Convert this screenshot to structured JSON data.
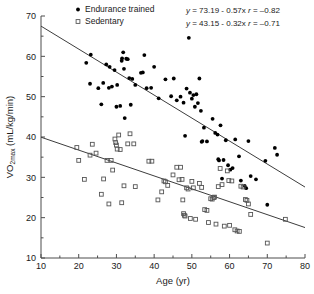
{
  "axes": {
    "x": {
      "label": "Age (yr)",
      "min": 10,
      "max": 80,
      "step": 10,
      "ticks": [
        "10",
        "20",
        "30",
        "40",
        "50",
        "60",
        "70",
        "80"
      ],
      "minor_step": 5
    },
    "y": {
      "label_main": "VO",
      "label_sub": "2max",
      "label_unit": " (mL/kg/min)",
      "label_full": "VO2max (mL/kg/min)",
      "min": 10,
      "max": 70,
      "step": 10,
      "ticks": [
        "10",
        "20",
        "30",
        "40",
        "50",
        "60",
        "70"
      ],
      "minor_step": 5
    }
  },
  "legend": {
    "items": [
      {
        "label": "Endurance trained",
        "marker": "filled-circle",
        "color": "#000000"
      },
      {
        "label": "Sedentary",
        "marker": "open-square",
        "color": "#555555"
      }
    ]
  },
  "annotations": [
    {
      "id": "eq-trained",
      "y": "y",
      "eq": " = 73.19 - 0.57x  ",
      "r": "r",
      "rval": " = –0.82"
    },
    {
      "id": "eq-sedentary",
      "y": "y",
      "eq": " = 43.15 - 0.32x  ",
      "r": "r",
      "rval": " = –0.71"
    }
  ],
  "chart_data": {
    "type": "scatter",
    "title": "",
    "xlabel": "Age (yr)",
    "ylabel": "VO2max (mL/kg/min)",
    "xlim": [
      10,
      80
    ],
    "ylim": [
      10,
      70
    ],
    "grid": false,
    "legend_position": "top-left",
    "series": [
      {
        "name": "Endurance trained",
        "marker": "filled-circle",
        "color": "#000000",
        "fit": {
          "intercept": 73.19,
          "slope": -0.57,
          "r": -0.82,
          "x_range": [
            10,
            80
          ]
        },
        "points": [
          [
            22.0,
            58.4
          ],
          [
            23.2,
            60.4
          ],
          [
            23.0,
            53.2
          ],
          [
            25.2,
            52.1
          ],
          [
            26.5,
            53.4
          ],
          [
            26.0,
            48.1
          ],
          [
            27.3,
            58.0
          ],
          [
            28.2,
            57.4
          ],
          [
            28.0,
            52.2
          ],
          [
            28.8,
            52.5
          ],
          [
            29.5,
            56.6
          ],
          [
            30.2,
            52.9
          ],
          [
            30.0,
            47.5
          ],
          [
            31.0,
            47.7
          ],
          [
            31.4,
            58.9
          ],
          [
            31.8,
            61.0
          ],
          [
            31.5,
            59.5
          ],
          [
            32.0,
            56.9
          ],
          [
            32.2,
            44.7
          ],
          [
            32.6,
            59.4
          ],
          [
            33.0,
            59.3
          ],
          [
            33.4,
            54.6
          ],
          [
            33.8,
            48.0
          ],
          [
            34.2,
            54.4
          ],
          [
            35.0,
            52.9
          ],
          [
            36.5,
            55.9
          ],
          [
            37.0,
            56.0
          ],
          [
            37.4,
            60.3
          ],
          [
            38.0,
            52.1
          ],
          [
            39.2,
            52.2
          ],
          [
            40.0,
            57.4
          ],
          [
            41.2,
            49.6
          ],
          [
            43.0,
            54.3
          ],
          [
            44.5,
            50.1
          ],
          [
            45.2,
            54.5
          ],
          [
            46.0,
            49.1
          ],
          [
            47.0,
            50.0
          ],
          [
            47.8,
            48.5
          ],
          [
            48.2,
            40.3
          ],
          [
            48.6,
            52.0
          ],
          [
            49.2,
            64.6
          ],
          [
            49.5,
            51.0
          ],
          [
            50.0,
            49.5
          ],
          [
            50.4,
            50.4
          ],
          [
            50.8,
            47.5
          ],
          [
            51.2,
            50.6
          ],
          [
            51.6,
            48.4
          ],
          [
            52.0,
            54.5
          ],
          [
            52.4,
            46.5
          ],
          [
            52.8,
            39.0
          ],
          [
            52.6,
            38.8
          ],
          [
            53.2,
            42.3
          ],
          [
            54.0,
            38.9
          ],
          [
            55.5,
            44.5
          ],
          [
            56.2,
            41.0
          ],
          [
            56.8,
            40.6
          ],
          [
            57.0,
            34.5
          ],
          [
            57.2,
            34.2
          ],
          [
            57.6,
            42.9
          ],
          [
            58.0,
            29.7
          ],
          [
            58.4,
            34.3
          ],
          [
            59.0,
            39.2
          ],
          [
            59.6,
            33.0
          ],
          [
            60.2,
            31.9
          ],
          [
            60.8,
            32.3
          ],
          [
            61.5,
            39.4
          ],
          [
            62.5,
            35.2
          ],
          [
            63.0,
            29.2
          ],
          [
            64.0,
            27.9
          ],
          [
            64.4,
            27.3
          ],
          [
            65.0,
            39.0
          ],
          [
            65.6,
            30.3
          ],
          [
            67.0,
            29.5
          ],
          [
            69.5,
            34.1
          ],
          [
            70.0,
            23.2
          ],
          [
            72.0,
            37.3
          ],
          [
            72.6,
            35.6
          ]
        ]
      },
      {
        "name": "Sedentary",
        "marker": "open-square",
        "color": "#555555",
        "fit": {
          "intercept": 43.15,
          "slope": -0.32,
          "r": -0.71,
          "x_range": [
            10,
            80
          ]
        },
        "points": [
          [
            19.5,
            37.4
          ],
          [
            20.0,
            34.2
          ],
          [
            21.5,
            29.5
          ],
          [
            23.0,
            35.5
          ],
          [
            23.6,
            38.2
          ],
          [
            24.6,
            36.0
          ],
          [
            26.0,
            25.8
          ],
          [
            26.6,
            29.6
          ],
          [
            27.5,
            34.2
          ],
          [
            28.0,
            23.4
          ],
          [
            28.6,
            34.2
          ],
          [
            29.0,
            31.8
          ],
          [
            29.6,
            39.5
          ],
          [
            29.8,
            38.6
          ],
          [
            30.0,
            38.0
          ],
          [
            30.2,
            37.0
          ],
          [
            30.6,
            40.5
          ],
          [
            31.0,
            36.9
          ],
          [
            31.4,
            23.7
          ],
          [
            32.0,
            27.9
          ],
          [
            33.0,
            38.3
          ],
          [
            33.6,
            40.8
          ],
          [
            34.6,
            38.3
          ],
          [
            35.0,
            27.7
          ],
          [
            38.6,
            34.0
          ],
          [
            39.4,
            34.0
          ],
          [
            41.0,
            24.4
          ],
          [
            42.0,
            26.4
          ],
          [
            42.6,
            29.1
          ],
          [
            43.0,
            28.9
          ],
          [
            43.6,
            28.0
          ],
          [
            45.0,
            30.6
          ],
          [
            46.0,
            32.5
          ],
          [
            46.6,
            29.4
          ],
          [
            47.0,
            32.5
          ],
          [
            47.4,
            29.5
          ],
          [
            47.6,
            24.4
          ],
          [
            47.8,
            21.0
          ],
          [
            48.0,
            20.6
          ],
          [
            48.2,
            20.4
          ],
          [
            48.6,
            27.4
          ],
          [
            49.0,
            27.1
          ],
          [
            49.6,
            19.8
          ],
          [
            50.0,
            29.0
          ],
          [
            50.4,
            27.4
          ],
          [
            51.0,
            19.6
          ],
          [
            52.0,
            28.5
          ],
          [
            52.6,
            27.5
          ],
          [
            53.4,
            22.0
          ],
          [
            54.0,
            21.8
          ],
          [
            54.4,
            18.8
          ],
          [
            55.0,
            24.7
          ],
          [
            55.4,
            24.6
          ],
          [
            55.8,
            25.0
          ],
          [
            56.0,
            25.1
          ],
          [
            56.4,
            18.4
          ],
          [
            57.0,
            27.7
          ],
          [
            57.5,
            32.2
          ],
          [
            58.0,
            28.2
          ],
          [
            58.6,
            17.9
          ],
          [
            59.4,
            31.6
          ],
          [
            59.8,
            29.2
          ],
          [
            60.0,
            18.1
          ],
          [
            60.6,
            29.1
          ],
          [
            61.4,
            17.0
          ],
          [
            62.0,
            16.7
          ],
          [
            62.6,
            16.6
          ],
          [
            63.0,
            27.8
          ],
          [
            63.6,
            27.6
          ],
          [
            64.2,
            24.5
          ],
          [
            64.6,
            24.3
          ],
          [
            65.0,
            23.4
          ],
          [
            65.6,
            20.8
          ],
          [
            70.0,
            13.7
          ],
          [
            74.8,
            19.6
          ]
        ]
      }
    ]
  }
}
